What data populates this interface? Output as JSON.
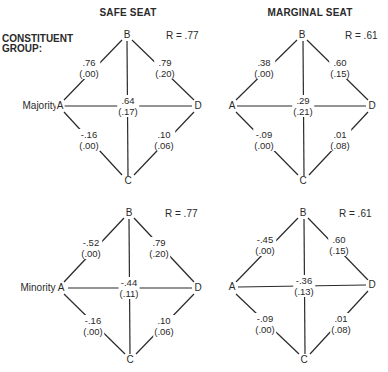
{
  "headers": {
    "safe": "SAFE SEAT",
    "marginal": "MARGINAL SEAT",
    "group_label_line1": "CONSTITUENT",
    "group_label_line2": "GROUP:"
  },
  "panels": [
    {
      "id": "majority-safe",
      "row_label": "Majority",
      "nodes": {
        "A": "A",
        "B": "B",
        "C": "C",
        "D": "D"
      },
      "r": "R = .77",
      "edges": {
        "AB": {
          "coef": ".76",
          "se": "(.00)"
        },
        "BD": {
          "coef": ".79",
          "se": "(.20)"
        },
        "center": {
          "coef": ".64",
          "se": "(.17)"
        },
        "AC": {
          "coef": "-.16",
          "se": "(.00)"
        },
        "CD": {
          "coef": ".10",
          "se": "(.06)"
        }
      }
    },
    {
      "id": "majority-marginal",
      "row_label": "",
      "nodes": {
        "A": "A",
        "B": "B",
        "C": "C",
        "D": "D"
      },
      "r": "R = .61",
      "edges": {
        "AB": {
          "coef": ".38",
          "se": "(.00)"
        },
        "BD": {
          "coef": ".60",
          "se": "(.15)"
        },
        "center": {
          "coef": ".29",
          "se": "(.21)"
        },
        "AC": {
          "coef": "-.09",
          "se": "(.00)"
        },
        "CD": {
          "coef": ".01",
          "se": "(.08)"
        }
      }
    },
    {
      "id": "minority-safe",
      "row_label": "Minority",
      "nodes": {
        "A": "A",
        "B": "B",
        "C": "C",
        "D": "D"
      },
      "r": "R = .77",
      "edges": {
        "AB": {
          "coef": "-.52",
          "se": "(.00)"
        },
        "BD": {
          "coef": ".79",
          "se": "(.20)"
        },
        "center": {
          "coef": "-.44",
          "se": "(.11)"
        },
        "AC": {
          "coef": "-.16",
          "se": "(.00)"
        },
        "CD": {
          "coef": ".10",
          "se": "(.06)"
        }
      }
    },
    {
      "id": "minority-marginal",
      "row_label": "",
      "nodes": {
        "A": "A",
        "B": "B",
        "C": "C",
        "D": "D"
      },
      "r": "R = .61",
      "edges": {
        "AB": {
          "coef": "-.45",
          "se": "(.00)"
        },
        "BD": {
          "coef": ".60",
          "se": "(.15)"
        },
        "center": {
          "coef": "-.36",
          "se": "(.13)"
        },
        "AC": {
          "coef": "-.09",
          "se": "(.00)"
        },
        "CD": {
          "coef": ".01",
          "se": "(.08)"
        }
      }
    }
  ]
}
